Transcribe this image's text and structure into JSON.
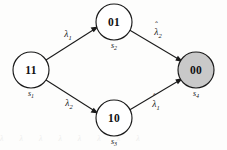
{
  "figure": {
    "type": "state-transition-diagram",
    "layout": "diamond",
    "background_color": "#fdfdfc",
    "stroke_color": "#1a1a1a",
    "shaded_fill_color": "#c9c9c9",
    "unshaded_fill_color": "#ffffff"
  },
  "nodes": [
    {
      "id": "s1",
      "code": "11",
      "state": "s",
      "index": "1",
      "cx": 31,
      "cy": 70,
      "r": 18,
      "shaded": false,
      "label_x": 31,
      "label_y": 70,
      "state_x": 31,
      "state_y": 94
    },
    {
      "id": "s2",
      "code": "01",
      "state": "s",
      "index": "2",
      "cx": 114,
      "cy": 22,
      "r": 18,
      "shaded": false,
      "label_x": 114,
      "label_y": 22,
      "state_x": 114,
      "state_y": 46
    },
    {
      "id": "s3",
      "code": "10",
      "state": "s",
      "index": "3",
      "cx": 114,
      "cy": 118,
      "r": 18,
      "shaded": false,
      "label_x": 114,
      "label_y": 118,
      "state_x": 114,
      "state_y": 142
    },
    {
      "id": "s4",
      "code": "00",
      "state": "s",
      "index": "4",
      "cx": 196,
      "cy": 70,
      "r": 18,
      "shaded": true,
      "label_x": 196,
      "label_y": 70,
      "state_x": 196,
      "state_y": 94
    }
  ],
  "edges": [
    {
      "id": "e1",
      "from": "s1",
      "to": "s2",
      "symbol": "λ",
      "subscript": "1",
      "hat": false,
      "label_x": 68,
      "label_y": 35,
      "x1": 46,
      "y1": 60,
      "x2": 97,
      "y2": 28
    },
    {
      "id": "e2",
      "from": "s2",
      "to": "s4",
      "symbol": "λ",
      "subscript": "2",
      "hat": true,
      "label_x": 158,
      "label_y": 33,
      "x1": 130,
      "y1": 30,
      "x2": 182,
      "y2": 61
    },
    {
      "id": "e3",
      "from": "s1",
      "to": "s3",
      "symbol": "λ",
      "subscript": "2",
      "hat": false,
      "label_x": 69,
      "label_y": 104,
      "x1": 46,
      "y1": 80,
      "x2": 97,
      "y2": 112
    },
    {
      "id": "e4",
      "from": "s3",
      "to": "s4",
      "symbol": "λ",
      "subscript": "1",
      "hat": true,
      "label_x": 156,
      "label_y": 105,
      "x1": 130,
      "y1": 110,
      "x2": 182,
      "y2": 79
    }
  ],
  "artifact": {
    "bleed_text": "λ λ λ λ λ λ λ λ"
  }
}
